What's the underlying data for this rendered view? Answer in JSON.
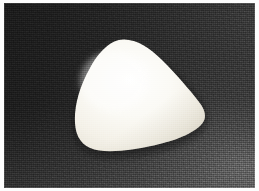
{
  "image": {
    "kind": "photograph",
    "width": 259,
    "height": 191,
    "caption": "Pale rounded-triangular object on a dark textured background",
    "subject_name": "rounded-triangular-object",
    "background_name": "dark-textured-surface"
  },
  "frame": {
    "border_color": "#fdfdfd",
    "border_width_px": 3
  },
  "background": {
    "description": "dark grey granular surface with diagonal luminance gradient, darkest at upper-left, lightest at lower-right",
    "color_darkest": "#1c1c1c",
    "color_mid": "#2d2d2d",
    "color_lightest": "#454545",
    "texture": "fine speckled grain"
  },
  "subject": {
    "description": "smooth pale cream rounded triangle with three rounded corners, apex up-left of centre, wide rounded base sloping down to the left",
    "fill_color": "#f7f5ee",
    "highlight_color": "#ffffff",
    "shadow_color": "#dcd8cc",
    "bounds_px": {
      "left": 70,
      "top": 36,
      "right": 205,
      "bottom": 150
    },
    "apex_px": {
      "x": 124,
      "y": 37
    },
    "left_corner_px": {
      "x": 72,
      "y": 116
    },
    "right_corner_px": {
      "x": 203,
      "y": 106
    },
    "bottom_left_px": {
      "x": 97,
      "y": 148
    }
  }
}
